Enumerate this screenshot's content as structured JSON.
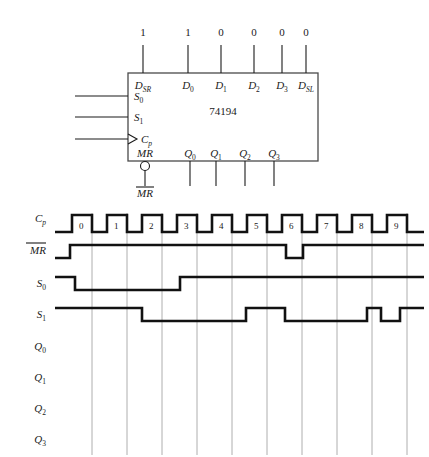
{
  "schematic": {
    "ic_name": "74194",
    "top_pins": [
      {
        "label": "D",
        "sub": "SR",
        "value": "1"
      },
      {
        "label": "D",
        "sub": "0",
        "value": "1"
      },
      {
        "label": "D",
        "sub": "1",
        "value": "0"
      },
      {
        "label": "D",
        "sub": "2",
        "value": "0"
      },
      {
        "label": "D",
        "sub": "3",
        "value": "0"
      },
      {
        "label": "D",
        "sub": "SL",
        "value": "0"
      }
    ],
    "left_pins": [
      {
        "label": "S",
        "sub": "0",
        "clock": false
      },
      {
        "label": "S",
        "sub": "1",
        "clock": false
      },
      {
        "label": "C",
        "sub": "p",
        "clock": true
      }
    ],
    "bottom_left_pin": {
      "label": "MR",
      "overbar": false,
      "bubble": true
    },
    "bottom_left_external": {
      "label": "MR",
      "overbar": true
    },
    "bottom_out_pins": [
      {
        "label": "Q",
        "sub": "0"
      },
      {
        "label": "Q",
        "sub": "1"
      },
      {
        "label": "Q",
        "sub": "2"
      },
      {
        "label": "Q",
        "sub": "3"
      }
    ]
  },
  "timing": {
    "cycle_labels": [
      "0",
      "1",
      "2",
      "3",
      "4",
      "5",
      "6",
      "7",
      "8",
      "9"
    ],
    "rows": [
      {
        "name": "Cp",
        "label": "C",
        "sub": "p",
        "overbar": false,
        "kind": "clock"
      },
      {
        "name": "MRbar",
        "label": "MR",
        "sub": "",
        "overbar": true,
        "kind": "wave"
      },
      {
        "name": "S0",
        "label": "S",
        "sub": "0",
        "overbar": false,
        "kind": "wave"
      },
      {
        "name": "S1",
        "label": "S",
        "sub": "1",
        "overbar": false,
        "kind": "wave"
      },
      {
        "name": "Q0",
        "label": "Q",
        "sub": "0",
        "overbar": false,
        "kind": "blank"
      },
      {
        "name": "Q1",
        "label": "Q",
        "sub": "1",
        "overbar": false,
        "kind": "blank"
      },
      {
        "name": "Q2",
        "label": "Q",
        "sub": "2",
        "overbar": false,
        "kind": "blank"
      },
      {
        "name": "Q3",
        "label": "Q",
        "sub": "3",
        "overbar": false,
        "kind": "blank"
      }
    ],
    "waveform_levels": {
      "MRbar": [
        0,
        1,
        1,
        1,
        1,
        1,
        1,
        "glitch-low",
        1,
        1,
        1
      ],
      "S0": [
        1,
        1,
        0,
        0,
        1,
        1,
        1,
        1,
        1,
        1,
        1
      ],
      "S1": [
        1,
        1,
        1,
        0,
        0,
        0,
        1,
        0,
        0,
        "pulse-high",
        1
      ]
    }
  }
}
